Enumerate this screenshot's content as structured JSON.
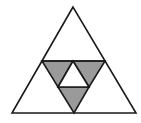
{
  "diagram": {
    "title": "",
    "colors": {
      "background": "#ffffff",
      "stroke": "#1a1a1a",
      "shaded": "#9a9a9a",
      "unshaded": "#ffffff"
    },
    "shapes": {
      "outer_triangle": {
        "points": "73,7 12,113 136,113",
        "fill": "unshaded"
      },
      "shaded_left": {
        "points": "42,61 73,61 58,87",
        "fill": "shaded"
      },
      "shaded_right": {
        "points": "73,61 105,61 89,87",
        "fill": "shaded"
      },
      "shaded_bottom": {
        "points": "58,87 89,87 74,113",
        "fill": "shaded"
      },
      "center_white": {
        "points": "73,61 58,87 89,87",
        "fill": "unshaded"
      },
      "midline": {
        "points": "42,61 105,61"
      }
    }
  }
}
